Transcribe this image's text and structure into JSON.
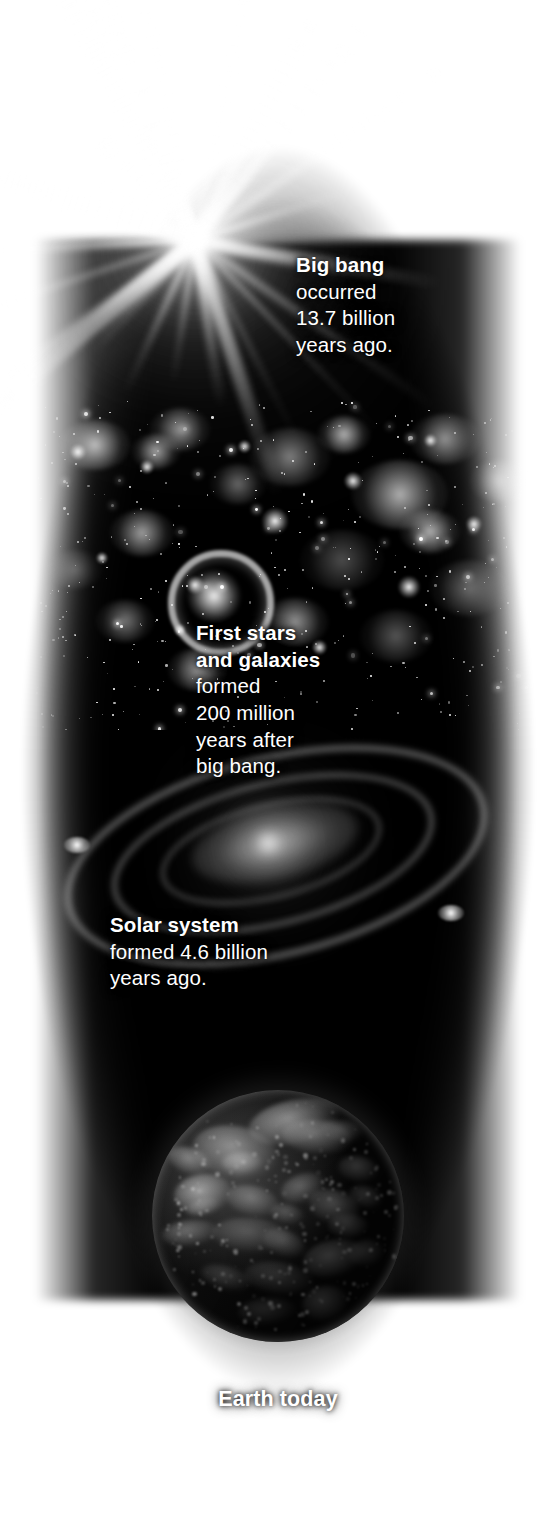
{
  "figure": {
    "background_color": "#ffffff",
    "column_color": "#000000",
    "text_color": "#ffffff"
  },
  "captions": {
    "big_bang": {
      "heading": "Big bang",
      "line1": "occurred",
      "line2": "13.7 billion",
      "line3": "years ago."
    },
    "first_stars": {
      "heading_line1": "First stars",
      "heading_line2": "and galaxies",
      "line1": "formed",
      "line2": "200 million",
      "line3": "years after",
      "line4": "big bang."
    },
    "solar_system": {
      "heading": "Solar system",
      "line1": "formed 4.6 billion",
      "line2": "years ago."
    },
    "earth": {
      "heading": "Earth today"
    }
  },
  "scenes": [
    {
      "name": "big-bang-starburst",
      "label": "Big bang"
    },
    {
      "name": "star-field",
      "label": "First stars and galaxies"
    },
    {
      "name": "spiral-galaxy",
      "label": "Solar system"
    },
    {
      "name": "earth-globe",
      "label": "Earth today"
    }
  ],
  "chart_data": {
    "type": "timeline",
    "orientation": "vertical",
    "unit": "years ago",
    "events": [
      {
        "label": "Big bang",
        "description": "occurred 13.7 billion years ago.",
        "value": 13.7,
        "unit": "billion years ago",
        "y": 0.16
      },
      {
        "label": "First stars and galaxies",
        "description": "formed 200 million years after big bang.",
        "value": 0.2,
        "unit": "billion years after big bang",
        "y": 0.45
      },
      {
        "label": "Solar system",
        "description": "formed 4.6 billion years ago.",
        "value": 4.6,
        "unit": "billion years ago",
        "y": 0.62
      },
      {
        "label": "Earth today",
        "description": "Earth today",
        "value": 0,
        "unit": "billion years ago",
        "y": 0.92
      }
    ]
  }
}
